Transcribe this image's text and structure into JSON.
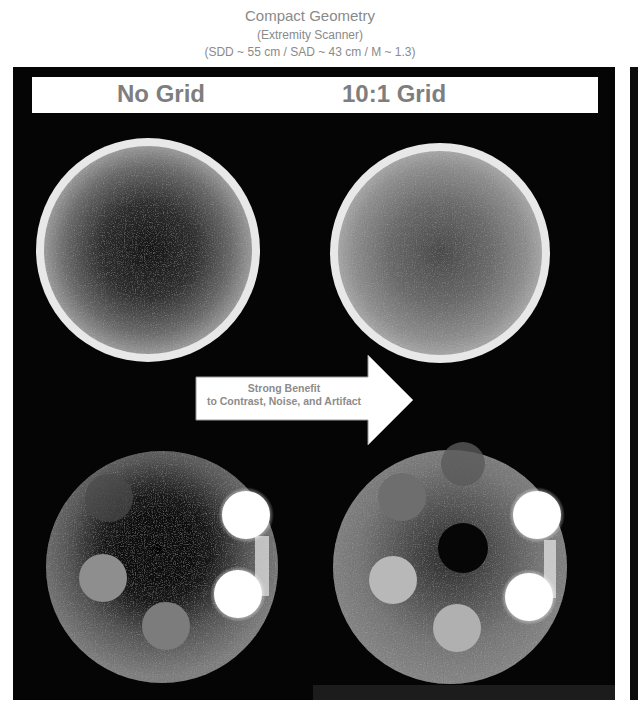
{
  "title": {
    "line1": "Compact Geometry",
    "line2": "(Extremity Scanner)",
    "line3": "(SDD ~ 55 cm / SAD ~ 43 cm / M ~ 1.3)"
  },
  "labels": {
    "left": "No Grid",
    "right": "10:1 Grid"
  },
  "arrow": {
    "line1": "Strong Benefit",
    "line2": "to Contrast, Noise, and Artifact"
  },
  "colors": {
    "background": "#ffffff",
    "panel": "#050505",
    "label_text": "#7e7e7e",
    "title_text": "#8a8a8a",
    "phantom_rim": "#e6e6e6",
    "insert_bright": "#ffffff"
  },
  "images": [
    {
      "position": "top-left",
      "condition": "No Grid",
      "type": "uniform-phantom"
    },
    {
      "position": "top-right",
      "condition": "10:1 Grid",
      "type": "uniform-phantom"
    },
    {
      "position": "bottom-left",
      "condition": "No Grid",
      "type": "insert-phantom"
    },
    {
      "position": "bottom-right",
      "condition": "10:1 Grid",
      "type": "insert-phantom"
    }
  ]
}
